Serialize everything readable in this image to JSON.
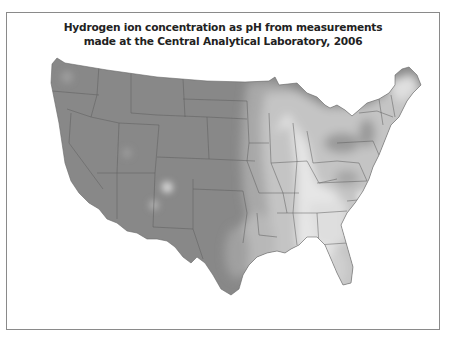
{
  "map": {
    "title_line1": "Hydrogen ion concentration as pH from measurements",
    "title_line2": "made at the Central Analytical Laboratory, 2006",
    "region": "Contiguous United States",
    "colors": {
      "frame": "#8a8a8a",
      "lowest_ph_dark": "#858585",
      "mid_dark": "#9c9c9c",
      "mid": "#b4b4b4",
      "mid_light": "#cdcdcd",
      "light": "#e4e4e4",
      "lightest": "#f2f2f2",
      "state_border": "#5a5a5a"
    },
    "description": "Grayscale shaded contour map of precipitation pH; western and central US uniform dark gray, eastern US lighter with darker patches around Ohio/Pennsylvania and lighter bands along the Mississippi valley and southeast"
  }
}
